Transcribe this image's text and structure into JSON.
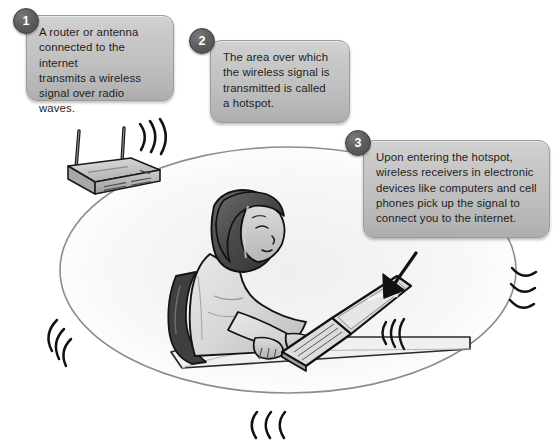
{
  "diagram": {
    "background_color": "#ffffff",
    "callouts": [
      {
        "number": "1",
        "text": "A router or antenna\nconnected to the internet\ntransmits a wireless\nsignal over radio waves."
      },
      {
        "number": "2",
        "text": "The area over which\nthe wireless signal is\ntransmitted is called\na hotspot."
      },
      {
        "number": "3",
        "text": "Upon entering the hotspot,\nwireless receivers in electronic\ndevices like computers and cell\nphones pick up the signal to\nconnect you to the internet."
      }
    ],
    "scene": {
      "hotspot_ellipse_label": "hotspot coverage area",
      "router_label": "wireless router with two antennas",
      "person_label": "woman seated at desk typing on laptop",
      "laptop_label": "open laptop computer",
      "chair_label": "office chair",
      "desk_label": "desk",
      "arrow_label": "arrow pointing to laptop",
      "signal_wave_groups": [
        "router-signal-waves",
        "laptop-signal-waves",
        "hotspot-left-waves",
        "hotspot-right-waves",
        "hotspot-bottom-waves"
      ]
    },
    "colors": {
      "callout_fill_top": "#d2d2d2",
      "callout_fill_bottom": "#adadad",
      "callout_border": "#9c9c9c",
      "badge_fill": "#5f5f5f",
      "badge_text": "#ffffff",
      "text": "#1d1d1d",
      "ink": "#1a1a1a",
      "ellipse_stroke": "#8d8d8d",
      "hair": "#4b4b4b",
      "skin": "#c8c8c8",
      "shirt": "#d9d9d9",
      "chair": "#3f3f3f",
      "router_body": "#b9b9b9",
      "laptop_screen": "#dcdcdc"
    }
  }
}
